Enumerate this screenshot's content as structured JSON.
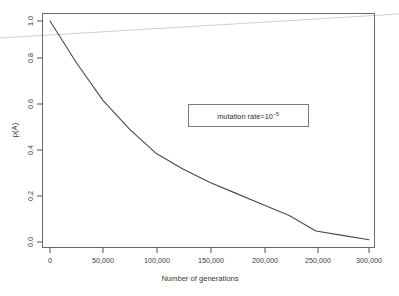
{
  "figure": {
    "background_color": "#ffffff",
    "frame_color": "#6a6a6a",
    "curve_color": "#4a4a4a"
  },
  "annotation": {
    "label_prefix": "mutation rate=10",
    "exponent": "−5",
    "full_text": "mutation rate=10−5"
  },
  "axes": {
    "x_title": "Number of generations",
    "y_title": "p(A)",
    "x_ticklabels": [
      "0",
      "50,000",
      "100,000",
      "150,000",
      "200,000",
      "250,000",
      "300,000"
    ],
    "y_ticklabels": [
      "0.0",
      "0.2",
      "0.4",
      "0.6",
      "0.8",
      "1.0"
    ]
  },
  "chart_data": {
    "type": "line",
    "title": "",
    "xlabel": "Number of generations",
    "ylabel": "p(A)",
    "xlim": [
      0,
      300000
    ],
    "ylim": [
      0.0,
      1.0
    ],
    "xticks": [
      0,
      50000,
      100000,
      150000,
      200000,
      250000,
      300000
    ],
    "yticks": [
      0.0,
      0.2,
      0.4,
      0.6,
      0.8,
      1.0
    ],
    "grid": false,
    "legend": false,
    "annotations": [
      {
        "text": "mutation rate=10−5",
        "x": 150000,
        "y": 0.55,
        "boxed": true
      }
    ],
    "series": [
      {
        "name": "p(A)",
        "x": [
          0,
          25000,
          50000,
          75000,
          100000,
          125000,
          150000,
          175000,
          200000,
          225000,
          250000,
          275000,
          300000
        ],
        "values": [
          1.0,
          0.81,
          0.64,
          0.51,
          0.4,
          0.33,
          0.27,
          0.22,
          0.17,
          0.12,
          0.05,
          0.03,
          0.01
        ]
      }
    ]
  }
}
